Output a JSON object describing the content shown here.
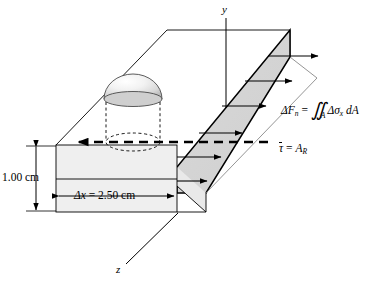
{
  "figure": {
    "background_color": "#ffffff",
    "line_color": "#000000",
    "cross_section_fill": "#d4d4d4",
    "front_face_fill": "#efefef",
    "dome_fill": "#e6e6e6"
  },
  "axes": {
    "y_label": "y",
    "z_label": "z"
  },
  "dimensions": {
    "height_label": "1.00 cm",
    "width_label_delta": "Δ",
    "width_label_var": "x",
    "width_label_value": " = 2.50 cm"
  },
  "equations": {
    "normal_force": {
      "lhs_delta": "Δ",
      "lhs_var": "F",
      "lhs_sub": "n",
      "equals": " = ",
      "integral": "∬",
      "integral_sub": "A",
      "rhs_delta": "Δ",
      "rhs_sigma": "σ",
      "rhs_sigma_sub": "x",
      "rhs_tail": " dA"
    },
    "shear": {
      "tau": "τ",
      "equals": " = ",
      "var": "A",
      "sub": "R"
    }
  },
  "stress_arrows": {
    "count": 6,
    "description": "stepped normal stress distribution arrows pointing in +x direction"
  },
  "features": {
    "dome_label": "dome",
    "neutral_axis_label": "neutral-axis dashed arrow"
  }
}
